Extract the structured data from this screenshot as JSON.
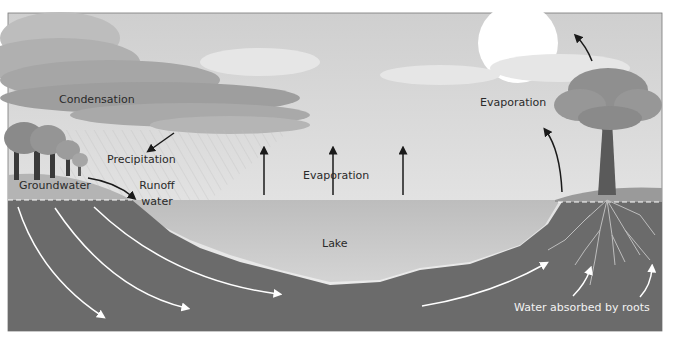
{
  "diagram": {
    "labels": {
      "condensation": "Condensation",
      "precipitation": "Precipitation",
      "evaporation_lake": "Evaporation",
      "evaporation_tree": "Evaporation",
      "groundwater": "Groundwater",
      "runoff_line1": "Runoff",
      "runoff_line2": "water",
      "lake": "Lake",
      "roots": "Water absorbed by roots"
    },
    "colors": {
      "sky": "#dcdcdc",
      "cloud_dark": "#a9a9a9",
      "sun": "#ffffff",
      "lake": "#c9c9c9",
      "soil": "#6b6b6b",
      "groundwater_zone": "#b4b4b4",
      "tree_canopy": "#8f8f8f",
      "trunk": "#5a5a5a",
      "arrow_dark": "#1a1a1a",
      "arrow_light": "#ffffff"
    }
  }
}
